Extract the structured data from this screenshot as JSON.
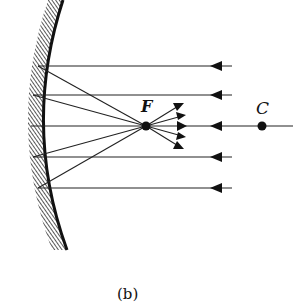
{
  "diagram": {
    "type": "concave-mirror-ray-diagram",
    "labels": {
      "focal_point": "F",
      "center_of_curvature": "C",
      "caption": "(b)"
    },
    "mirror": {
      "shape": "concave",
      "hatching": "back-side"
    },
    "incident_rays": {
      "count": 5,
      "direction": "right-to-left",
      "parallel_to_axis": true
    },
    "reflected_rays": {
      "converge_at": "F",
      "diverge_after_focus": true
    },
    "colors": {
      "ink": "#111111",
      "background": "#ffffff"
    }
  }
}
